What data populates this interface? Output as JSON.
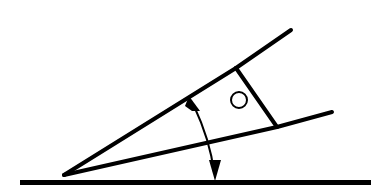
{
  "figure": {
    "background_color": "#ffffff",
    "ink_color": "#000000",
    "canvas": {
      "width": 383,
      "height": 193
    }
  },
  "ground": {
    "label": "ground-reference-line",
    "x_start": 20,
    "x_end": 371,
    "y": 183,
    "thickness": 5,
    "color": "#000000"
  },
  "wedge": {
    "label": "wedge-outline",
    "apex": {
      "x": 64,
      "y": 175
    },
    "stroke_width": 4,
    "upper_edge": {
      "from_x": 64,
      "from_y": 175,
      "to_x": 236,
      "to_y": 68
    },
    "lower_edge": {
      "from_x": 64,
      "from_y": 175,
      "to_x": 277,
      "to_y": 127
    }
  },
  "body": {
    "label": "tool-head-body",
    "points": "236,68 277,127",
    "stroke_width": 4
  },
  "prongs": {
    "upper": {
      "label": "upper-prong",
      "from_x": 236,
      "from_y": 68,
      "to_x": 291,
      "to_y": 30,
      "stroke_width": 4
    },
    "lower": {
      "label": "lower-prong",
      "from_x": 277,
      "from_y": 127,
      "to_x": 332,
      "to_y": 112,
      "stroke_width": 4
    }
  },
  "pivot_circle": {
    "label": "pivot-hole",
    "cx": 239,
    "cy": 100,
    "r": 8,
    "stroke_width": 2
  },
  "angle_arrow": {
    "label": "angle-indicator-arc",
    "stroke_width": 2,
    "arc_path": "M 194 106 Q 210 140 214 172",
    "head_top": {
      "tip_x": 189,
      "tip_y": 96,
      "points": "189,96 200,111 192,111 185,106"
    },
    "head_bottom": {
      "tip_x": 215,
      "tip_y": 181,
      "points": "215,181 209,160 221,160"
    }
  }
}
